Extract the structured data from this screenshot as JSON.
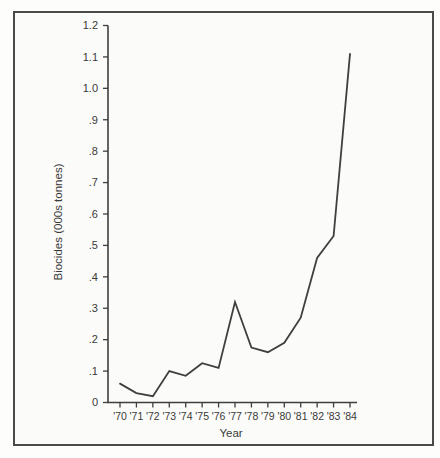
{
  "window": {
    "background": "#fdfdfb"
  },
  "frame": {
    "border_color": "#4a4a4a",
    "background": "#fbfbf9"
  },
  "chart_data": {
    "type": "line",
    "title": "",
    "xlabel": "Year",
    "ylabel": "Biocides (000s tonnes)",
    "categories": [
      "'70",
      "'71",
      "'72",
      "'73",
      "'74",
      "'75",
      "'76",
      "'77",
      "'78",
      "'79",
      "'80",
      "'81",
      "'82",
      "'83",
      "'84"
    ],
    "series": [
      {
        "name": "Biocides",
        "values": [
          0.06,
          0.03,
          0.02,
          0.1,
          0.085,
          0.125,
          0.11,
          0.32,
          0.175,
          0.16,
          0.19,
          0.27,
          0.46,
          0.53,
          1.11
        ]
      }
    ],
    "y_tick_labels": [
      "0",
      ".1",
      ".2",
      ".3",
      ".4",
      ".5",
      ".6",
      ".7",
      ".8",
      ".9",
      "1.0",
      "1.1",
      "1.2"
    ],
    "y_tick_values": [
      0,
      0.1,
      0.2,
      0.3,
      0.4,
      0.5,
      0.6,
      0.7,
      0.8,
      0.9,
      1.0,
      1.1,
      1.2
    ],
    "ylim": [
      0,
      1.2
    ],
    "grid": false,
    "legend": "none",
    "line_color": "#3f3f3f",
    "axis_color": "#3f3f3f",
    "text_color": "#3a3a3a"
  }
}
